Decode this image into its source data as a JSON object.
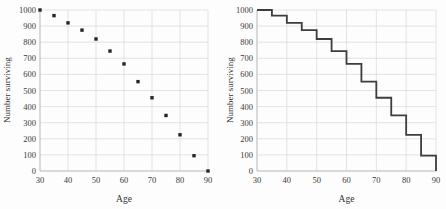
{
  "page": {
    "background": "#fdfdfd"
  },
  "colors": {
    "grid": "#dcdcdc",
    "axis": "#c2c2c2",
    "marker": "#262626",
    "step_line": "#3d3d3d",
    "text": "#3a3a3a"
  },
  "chart_data": [
    {
      "type": "scatter",
      "title": "",
      "xlabel": "Age",
      "ylabel": "Number surviving",
      "x": [
        30,
        35,
        40,
        45,
        50,
        55,
        60,
        65,
        70,
        75,
        80,
        85,
        90
      ],
      "y": [
        1000,
        965,
        920,
        875,
        820,
        745,
        665,
        555,
        455,
        345,
        225,
        95,
        0
      ],
      "xlim": [
        30,
        90
      ],
      "ylim": [
        0,
        1000
      ],
      "xticks": [
        30,
        40,
        50,
        60,
        70,
        80,
        90
      ],
      "yticks": [
        0,
        100,
        200,
        300,
        400,
        500,
        600,
        700,
        800,
        900,
        1000
      ],
      "grid": true,
      "legend": false
    },
    {
      "type": "step",
      "title": "",
      "xlabel": "Age",
      "ylabel": "Number surviving",
      "x": [
        30,
        35,
        40,
        45,
        50,
        55,
        60,
        65,
        70,
        75,
        80,
        85,
        90
      ],
      "y": [
        1000,
        965,
        920,
        875,
        820,
        745,
        665,
        555,
        455,
        345,
        225,
        95,
        0
      ],
      "xlim": [
        30,
        90
      ],
      "ylim": [
        0,
        1000
      ],
      "xticks": [
        30,
        40,
        50,
        60,
        70,
        80,
        90
      ],
      "yticks": [
        0,
        100,
        200,
        300,
        400,
        500,
        600,
        700,
        800,
        900,
        1000
      ],
      "grid": true,
      "legend": false
    }
  ]
}
